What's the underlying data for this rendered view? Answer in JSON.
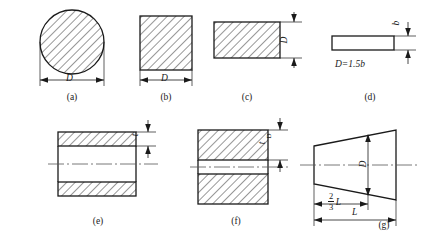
{
  "sheet": {
    "title": "Forging stock cross-section and billet proportion figures",
    "background_color": "#ffffff",
    "line_color": "#1a1a1a",
    "hatch_color": "#1a1a1a"
  },
  "figures": [
    {
      "id": "a",
      "caption": "(a)",
      "shape": "circle",
      "hatched": true,
      "dimensions": [
        {
          "name": "diameter",
          "label": "D",
          "orientation": "horizontal"
        }
      ]
    },
    {
      "id": "b",
      "caption": "(b)",
      "shape": "square",
      "hatched": true,
      "dimensions": [
        {
          "name": "width",
          "label": "D",
          "orientation": "horizontal"
        }
      ]
    },
    {
      "id": "c",
      "caption": "(c)",
      "shape": "rectangle-wide",
      "hatched": true,
      "dimensions": [
        {
          "name": "height",
          "label": "D",
          "orientation": "vertical"
        }
      ]
    },
    {
      "id": "d",
      "caption": "(d)",
      "shape": "flat-bar",
      "hatched": false,
      "note": "D=1.5b",
      "dimensions": [
        {
          "name": "thickness",
          "label": "b",
          "orientation": "vertical"
        }
      ]
    },
    {
      "id": "e",
      "caption": "(e)",
      "shape": "hollow-cylinder-section",
      "hatched": true,
      "centerline": true,
      "dimensions": [
        {
          "name": "wall-thickness",
          "label": "t",
          "orientation": "vertical"
        }
      ]
    },
    {
      "id": "f",
      "caption": "(f)",
      "shape": "hollow-cylinder-section-thick",
      "hatched": true,
      "centerline": true,
      "dimensions": [
        {
          "name": "wall-thickness",
          "label": "t",
          "sublabel": "D",
          "orientation": "vertical"
        }
      ]
    },
    {
      "id": "g",
      "caption": "(g)",
      "shape": "tapered-trapezoid",
      "hatched": false,
      "centerline": true,
      "dimensions": [
        {
          "name": "diameter",
          "label": "D",
          "orientation": "vertical"
        },
        {
          "name": "partial-length",
          "label": "L",
          "prefix_num": "2",
          "prefix_den": "3",
          "orientation": "horizontal"
        },
        {
          "name": "total-length",
          "label": "L",
          "orientation": "horizontal"
        }
      ]
    }
  ]
}
